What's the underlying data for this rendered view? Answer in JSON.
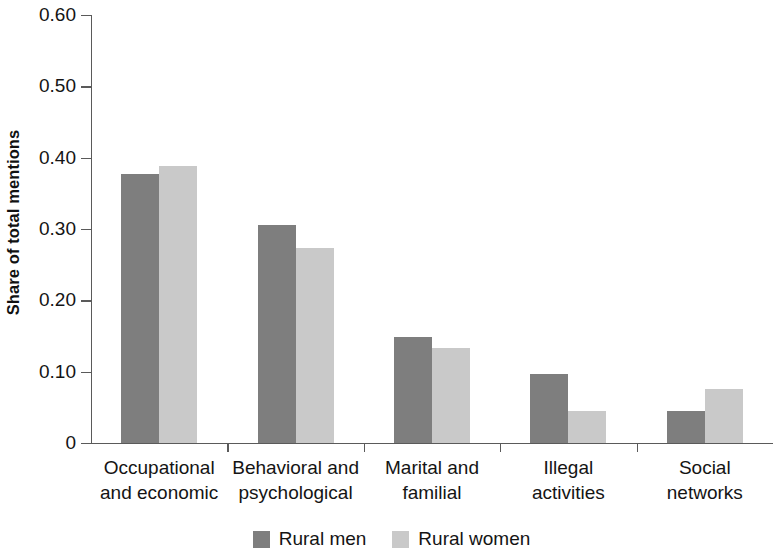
{
  "chart_data": {
    "type": "bar",
    "title": "",
    "subtitle": "",
    "xlabel": "",
    "ylabel": "Share of total mentions",
    "categories": [
      "Occupational and economic",
      "Behavioral and psychological",
      "Marital and familial",
      "Illegal activities",
      "Social networks"
    ],
    "category_lines": [
      [
        "Occupational",
        "and economic"
      ],
      [
        "Behavioral and",
        "psychological"
      ],
      [
        "Marital and",
        "familial"
      ],
      [
        "Illegal",
        "activities"
      ],
      [
        "Social",
        "networks"
      ]
    ],
    "series": [
      {
        "name": "Rural men",
        "color": "#7e7e7e",
        "values": [
          0.377,
          0.305,
          0.149,
          0.097,
          0.045
        ]
      },
      {
        "name": "Rural women",
        "color": "#c9c9c9",
        "values": [
          0.388,
          0.274,
          0.133,
          0.045,
          0.076
        ]
      }
    ],
    "ylim": [
      0,
      0.6
    ],
    "ytick_values": [
      0.6,
      0.5,
      0.4,
      0.3,
      0.2,
      0.1,
      0
    ],
    "ytick_labels": [
      "0.60",
      "0.50",
      "0.40",
      "0.30",
      "0.20",
      "0.10",
      "0"
    ],
    "grid": false,
    "legend_position": "bottom-center",
    "legend": [
      {
        "label": "Rural men",
        "color": "#7e7e7e"
      },
      {
        "label": "Rural women",
        "color": "#c9c9c9"
      }
    ]
  }
}
